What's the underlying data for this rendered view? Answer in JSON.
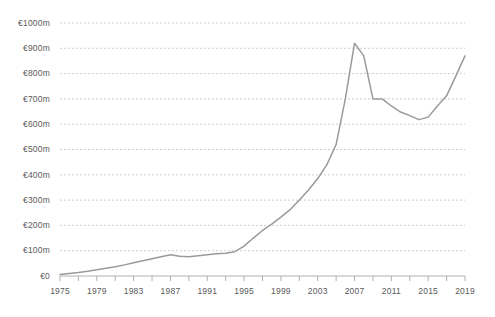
{
  "chart_data": {
    "type": "line",
    "title": "",
    "subtitle": "",
    "xlabel": "",
    "ylabel": "",
    "xlim": [
      1975,
      2019
    ],
    "ylim": [
      0,
      1000
    ],
    "grid": true,
    "legend": false,
    "legend_position": "none",
    "currency_symbol": "€",
    "value_unit": "m",
    "line_color": "#9a9a9a",
    "gridline_color": "#b9b9b9",
    "axis_color": "#b0b0b0",
    "label_color": "#5a5a5a",
    "background_color": "#ffffff",
    "ytick_labels": [
      "€1000m",
      "€900m",
      "€800m",
      "€700m",
      "€600m",
      "€500m",
      "€400m",
      "€300m",
      "€200m",
      "€100m",
      "€0"
    ],
    "ytick_values": [
      1000,
      900,
      800,
      700,
      600,
      500,
      400,
      300,
      200,
      100,
      0
    ],
    "xtick_labels": [
      "1975",
      "1979",
      "1983",
      "1987",
      "1991",
      "1995",
      "1999",
      "2003",
      "2007",
      "2011",
      "2015",
      "2019"
    ],
    "xtick_values": [
      1975,
      1979,
      1983,
      1987,
      1991,
      1995,
      1999,
      2003,
      2007,
      2011,
      2015,
      2019
    ],
    "xminor_tick_values": [
      1975,
      1977,
      1979,
      1981,
      1983,
      1985,
      1987,
      1989,
      1991,
      1993,
      1995,
      1997,
      1999,
      2001,
      2003,
      2005,
      2007,
      2009,
      2011,
      2013,
      2015,
      2017,
      2019
    ],
    "x": [
      1975,
      1976,
      1977,
      1978,
      1979,
      1980,
      1981,
      1982,
      1983,
      1984,
      1985,
      1986,
      1987,
      1988,
      1989,
      1990,
      1991,
      1992,
      1993,
      1994,
      1995,
      1996,
      1997,
      1998,
      1999,
      2000,
      2001,
      2002,
      2003,
      2004,
      2005,
      2006,
      2007,
      2008,
      2009,
      2010,
      2011,
      2012,
      2013,
      2014,
      2015,
      2016,
      2017,
      2018,
      2019
    ],
    "values": [
      6,
      10,
      14,
      19,
      25,
      31,
      37,
      44,
      52,
      60,
      68,
      76,
      84,
      78,
      76,
      80,
      84,
      88,
      90,
      96,
      118,
      150,
      180,
      205,
      233,
      262,
      300,
      340,
      385,
      440,
      520,
      700,
      920,
      870,
      700,
      700,
      672,
      648,
      634,
      618,
      628,
      672,
      712,
      790,
      870
    ],
    "series": [
      {
        "name": "Value",
        "values": [
          6,
          10,
          14,
          19,
          25,
          31,
          37,
          44,
          52,
          60,
          68,
          76,
          84,
          78,
          76,
          80,
          84,
          88,
          90,
          96,
          118,
          150,
          180,
          205,
          233,
          262,
          300,
          340,
          385,
          440,
          520,
          700,
          920,
          870,
          700,
          700,
          672,
          648,
          634,
          618,
          628,
          672,
          712,
          790,
          870
        ]
      }
    ],
    "annotations": []
  },
  "plot_geometry": {
    "left": 60,
    "right": 465,
    "top": 23,
    "bottom": 276
  }
}
